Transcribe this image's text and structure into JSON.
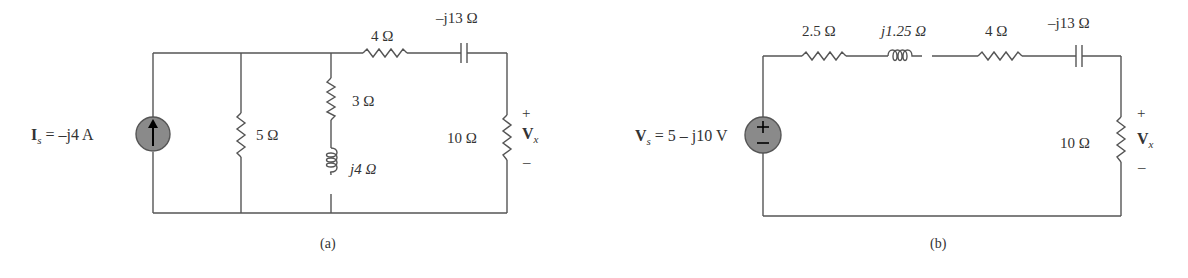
{
  "circuit_a": {
    "caption": "(a)",
    "source": {
      "type": "current",
      "label_symbol": "I",
      "label_sub": "s",
      "label_value": " = –j4 A"
    },
    "components": {
      "r5": "5 Ω",
      "r3": "3 Ω",
      "l4": "j4 Ω",
      "r4": "4 Ω",
      "c13": "–j13 Ω",
      "r10": "10 Ω"
    },
    "output": {
      "plus": "+",
      "minus": "–",
      "symbol": "V",
      "sub": "x"
    }
  },
  "circuit_b": {
    "caption": "(b)",
    "source": {
      "type": "voltage",
      "label_symbol": "V",
      "label_sub": "s",
      "label_value": " = 5 – j10 V"
    },
    "components": {
      "r25": "2.5 Ω",
      "l125": "j1.25 Ω",
      "r4": "4 Ω",
      "c13": "–j13 Ω",
      "r10": "10 Ω"
    },
    "output": {
      "plus": "+",
      "minus": "–",
      "symbol": "V",
      "sub": "x"
    }
  }
}
